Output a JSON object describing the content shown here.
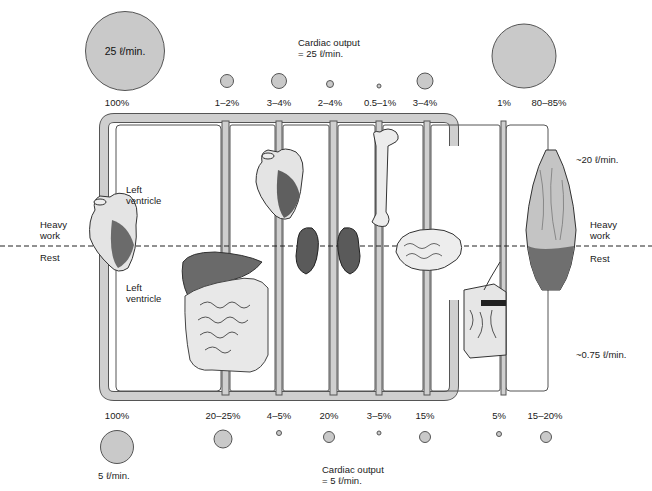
{
  "diagram": {
    "heavy_work": {
      "cardiac_output_label": "Cardiac output",
      "cardiac_output_value": "= 25 ℓ/min.",
      "total_circle_label": "25 ℓ/min.",
      "total_percent": "100%",
      "muscle_flow": "~20 ℓ/min.",
      "organs": [
        {
          "name": "Heart (coronary)",
          "percent": "1–2%"
        },
        {
          "name": "Liver/GI",
          "percent": "3–4%"
        },
        {
          "name": "Kidneys",
          "percent": "2–4%"
        },
        {
          "name": "Bone",
          "percent": "0.5–1%"
        },
        {
          "name": "Brain",
          "percent": "3–4%"
        },
        {
          "name": "Skin",
          "percent": "1%"
        },
        {
          "name": "Muscle",
          "percent": "80–85%"
        }
      ]
    },
    "rest": {
      "cardiac_output_label": "Cardiac output",
      "cardiac_output_value": "= 5 ℓ/min.",
      "total_circle_label": "5 ℓ/min.",
      "total_percent": "100%",
      "muscle_flow": "~0.75 ℓ/min.",
      "organs": [
        {
          "name": "Liver/GI",
          "percent": "20–25%"
        },
        {
          "name": "Heart (coronary)",
          "percent": "4–5%"
        },
        {
          "name": "Kidneys",
          "percent": "20%"
        },
        {
          "name": "Bone",
          "percent": "3–5%"
        },
        {
          "name": "Brain",
          "percent": "15%"
        },
        {
          "name": "Skin",
          "percent": "5%"
        },
        {
          "name": "Muscle",
          "percent": "15–20%"
        }
      ]
    },
    "labels": {
      "heavy_work_left": "Heavy\nwork",
      "rest_left": "Rest",
      "heavy_work_right": "Heavy\nwork",
      "rest_right": "Rest",
      "left_ventricle_top": "Left\nventricle",
      "left_ventricle_bottom": "Left\nventricle"
    }
  }
}
